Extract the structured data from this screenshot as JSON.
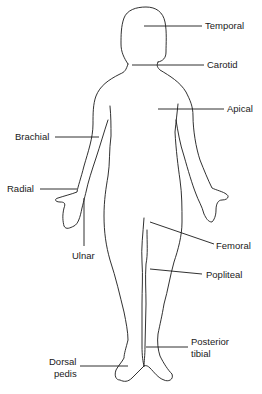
{
  "diagram": {
    "labels": {
      "temporal": "Temporal",
      "carotid": "Carotid",
      "apical": "Apical",
      "brachial": "Brachial",
      "radial": "Radial",
      "ulnar": "Ulnar",
      "femoral": "Femoral",
      "popliteal": "Popliteal",
      "posterior_tibial_line1": "Posterior",
      "posterior_tibial_line2": "tibial",
      "dorsal_pedis_line1": "Dorsal",
      "dorsal_pedis_line2": "pedis"
    },
    "colors": {
      "line": "#1a1a1a",
      "background": "#ffffff"
    }
  }
}
